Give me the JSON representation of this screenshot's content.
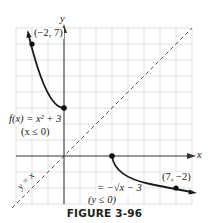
{
  "figure": {
    "caption": "FIGURE 3-96",
    "axis_labels": {
      "x": "x",
      "y": "y"
    },
    "grid": {
      "x_min": -3,
      "x_max": 9,
      "y_min": -3,
      "y_max": 8,
      "step": 1
    },
    "curves": [
      {
        "name": "f",
        "label_line1": "f(x) = x² + 3",
        "label_line2": "(x ≤ 0)",
        "domain": "x ≤ 0",
        "color": "#222222"
      },
      {
        "name": "f-inverse",
        "label_line1": "= −√x − 3",
        "label_line2": "(y ≤ 0)",
        "domain": "x ≥ 3",
        "color": "#222222"
      },
      {
        "name": "identity",
        "label": "y = x",
        "style": "dashed",
        "color": "#555555"
      }
    ],
    "points": [
      {
        "label": "(−2, 7)",
        "x": -2,
        "y": 7
      },
      {
        "label": "(0, 3)",
        "x": 0,
        "y": 3,
        "labeled": false
      },
      {
        "label": "(3, 0)",
        "x": 3,
        "y": 0,
        "labeled": false
      },
      {
        "label": "(7, −2)",
        "x": 7,
        "y": -2
      }
    ],
    "colors": {
      "grid": "#d6d6d6",
      "axis": "#333333",
      "curve": "#1a1a1a",
      "dash": "#555555"
    }
  }
}
